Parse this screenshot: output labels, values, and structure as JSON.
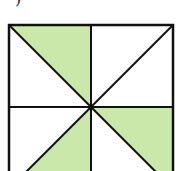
{
  "figure": {
    "label_fragment": ")",
    "colors": {
      "shade": "#c9e8a9",
      "stroke": "#111111",
      "background": "#ffffff"
    },
    "square": {
      "x": 9,
      "y": 25,
      "size": 164
    },
    "center": {
      "x": 91,
      "y": 107
    },
    "shaded_triangles": [
      {
        "name": "top-left-upper",
        "points": "9,25 91,25 91,107"
      },
      {
        "name": "right-lower",
        "points": "91,107 173,107 173,189"
      },
      {
        "name": "bottom-left-lower",
        "points": "91,107 91,189 9,189"
      }
    ],
    "total_triangles": 8,
    "shaded_count": 3
  }
}
